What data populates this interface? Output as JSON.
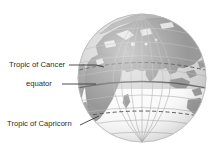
{
  "figure": {
    "type": "diagram",
    "width": 216,
    "height": 156,
    "background_color": "#ffffff"
  },
  "labels": [
    {
      "id": "tropic-of-cancer",
      "text": "Tropic of Cancer",
      "leader": "horizontal-to-globe"
    },
    {
      "id": "equator",
      "text": "equator",
      "leader": "horizontal-to-globe"
    },
    {
      "id": "tropic-of-capricorn",
      "text": "Tropic of Capricorn",
      "leader": "diagonal-up-right-to-globe"
    }
  ],
  "globe": {
    "center_x": 142,
    "center_y": 78,
    "radius": 64,
    "northern_hemisphere_color": "#9a9a9a",
    "southern_hemisphere_color": "#f2f2f2",
    "ocean_color": "#dcdcdc",
    "land_color": "#8e8e8e",
    "graticule_color": "#b4b4b4",
    "equator_line_color": "#6e6e6e",
    "tropic_line_style": "dashed",
    "tropic_line_color": "#5a5a5a",
    "view": "africa-eurasia-indian-ocean"
  },
  "colors": {
    "text": "#2b2b2b",
    "leader_line": "#3a3a3a"
  }
}
